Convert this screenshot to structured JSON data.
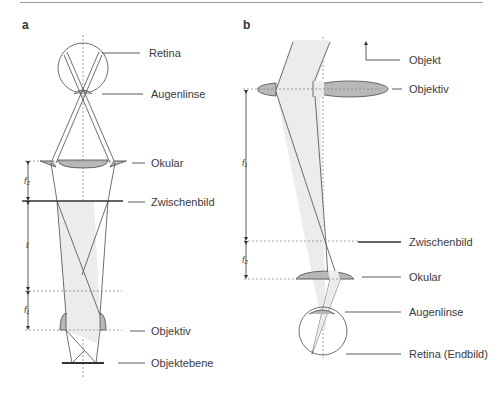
{
  "panels": {
    "a": {
      "letter": "a",
      "labels": {
        "retina": "Retina",
        "augenlinse": "Augenlinse",
        "okular": "Okular",
        "zwischenbild": "Zwischenbild",
        "objektiv": "Objektiv",
        "objektebene": "Objektebene"
      },
      "dimensions": {
        "f2": "f₂",
        "t": "t",
        "f1": "f₁"
      }
    },
    "b": {
      "letter": "b",
      "labels": {
        "objekt": "Objekt",
        "objektiv": "Objektiv",
        "zwischenbild": "Zwischenbild",
        "okular": "Okular",
        "augenlinse": "Augenlinse",
        "retina": "Retina (Endbild)"
      },
      "dimensions": {
        "f1": "f₁",
        "f2": "f₂"
      }
    }
  },
  "colors": {
    "line": "#4a4a4a",
    "lens_fill": "#b8b8b8",
    "beam_fill": "#ececec",
    "axis": "#888888"
  }
}
